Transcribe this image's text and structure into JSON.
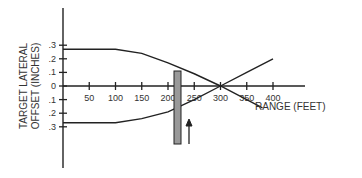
{
  "chart_data": {
    "type": "line",
    "title": "",
    "xlabel": "RANGE (FEET)",
    "ylabel": "TARGET LATERAL OFFSET (INCHES)",
    "ylabel_lines": [
      "TARGET LATERAL",
      "OFFSET (INCHES)"
    ],
    "x_ticks": [
      50,
      100,
      150,
      200,
      250,
      300,
      350,
      400
    ],
    "x_tick_labels": [
      "50",
      "100",
      "150",
      "200",
      "250",
      "300",
      "350",
      "400"
    ],
    "y_tick_labels": [
      ".3",
      ".2",
      ".1",
      "0",
      ".1",
      ".2",
      ".3"
    ],
    "xlim": [
      0,
      450
    ],
    "ylim": [
      -0.3,
      0.3
    ],
    "series": [
      {
        "name": "upper-trajectory",
        "x": [
          0,
          100,
          150,
          200,
          250,
          300,
          350,
          380
        ],
        "y": [
          0.27,
          0.27,
          0.24,
          0.17,
          0.09,
          0.0,
          -0.1,
          -0.16
        ]
      },
      {
        "name": "lower-trajectory",
        "x": [
          0,
          100,
          150,
          200,
          250,
          300,
          350,
          400
        ],
        "y": [
          -0.27,
          -0.27,
          -0.24,
          -0.19,
          -0.1,
          0.0,
          0.1,
          0.2
        ]
      }
    ],
    "annotations": [
      {
        "type": "shaded-bar",
        "x_range": [
          215,
          228
        ],
        "y_range": [
          0.18,
          -0.3
        ]
      },
      {
        "type": "arrow",
        "x": 235,
        "direction": "up"
      }
    ],
    "grid": false,
    "legend": "none"
  }
}
